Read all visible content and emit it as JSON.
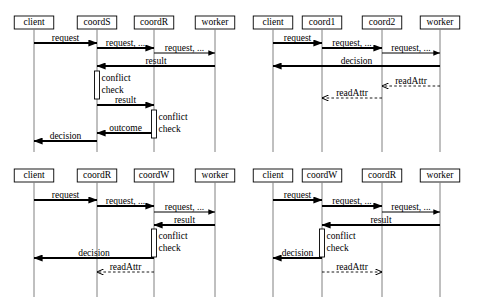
{
  "diagram": {
    "type": "uml-sequence-diagram-grid",
    "panel_count": 4,
    "colors": {
      "background": "#ffffff",
      "stroke": "#000000",
      "lifeline": "#808080",
      "activation_fill": "#ffffff"
    },
    "panels": [
      {
        "id": "panel-top-left",
        "position": "top-left",
        "participants": [
          {
            "name": "client",
            "x": 34
          },
          {
            "name": "coordS",
            "x": 97
          },
          {
            "name": "coordR",
            "x": 154
          },
          {
            "name": "worker",
            "x": 215
          }
        ],
        "messages": [
          {
            "label": "request",
            "from": "client",
            "to": "coordS",
            "y": 43,
            "style": "solid",
            "dir": "right",
            "thick": true
          },
          {
            "label": "request, ...",
            "from": "coordS",
            "to": "coordR",
            "y": 48,
            "style": "solid",
            "dir": "right",
            "thick": true
          },
          {
            "label": "request, ...",
            "from": "coordR",
            "to": "worker",
            "y": 53,
            "style": "solid",
            "dir": "right",
            "thick": false
          },
          {
            "label": "result",
            "from": "worker",
            "to": "coordS",
            "y": 66,
            "style": "solid",
            "dir": "left",
            "thick": true
          },
          {
            "label": "result",
            "from": "coordS",
            "to": "coordR",
            "y": 105,
            "style": "solid",
            "dir": "right",
            "thick": true
          },
          {
            "label": "outcome",
            "from": "coordR",
            "to": "coordS",
            "y": 133,
            "style": "solid",
            "dir": "left",
            "thick": true
          },
          {
            "label": "decision",
            "from": "coordS",
            "to": "client",
            "y": 141,
            "style": "solid",
            "dir": "left",
            "thick": true
          }
        ],
        "activations": [
          {
            "on": "coordS",
            "y1": 71,
            "y2": 99,
            "note": "conflict\ncheck"
          },
          {
            "on": "coordR",
            "y1": 110,
            "y2": 138,
            "note": "conflict\ncheck"
          }
        ]
      },
      {
        "id": "panel-top-right",
        "position": "top-right",
        "participants": [
          {
            "name": "client",
            "x": 273
          },
          {
            "name": "coord1",
            "x": 322
          },
          {
            "name": "coord2",
            "x": 382
          },
          {
            "name": "worker",
            "x": 440
          }
        ],
        "messages": [
          {
            "label": "request",
            "from": "client",
            "to": "coord1",
            "y": 43,
            "style": "solid",
            "dir": "right",
            "thick": true
          },
          {
            "label": "request, ...",
            "from": "coord1",
            "to": "coord2",
            "y": 48,
            "style": "solid",
            "dir": "right",
            "thick": true
          },
          {
            "label": "request, ...",
            "from": "coord2",
            "to": "worker",
            "y": 53,
            "style": "solid",
            "dir": "right",
            "thick": false
          },
          {
            "label": "decision",
            "from": "worker",
            "to": "client",
            "y": 66,
            "style": "solid",
            "dir": "left",
            "thick": true
          },
          {
            "label": "readAttr",
            "from": "worker",
            "to": "coord2",
            "y": 86,
            "style": "dashed",
            "dir": "left",
            "thick": false
          },
          {
            "label": "readAttr",
            "from": "coord2",
            "to": "coord1",
            "y": 98,
            "style": "dashed",
            "dir": "left",
            "thick": false
          }
        ],
        "activations": []
      },
      {
        "id": "panel-bottom-left",
        "position": "bottom-left",
        "participants": [
          {
            "name": "client",
            "x": 34
          },
          {
            "name": "coordR",
            "x": 97
          },
          {
            "name": "coordW",
            "x": 154
          },
          {
            "name": "worker",
            "x": 215
          }
        ],
        "messages": [
          {
            "label": "request",
            "from": "client",
            "to": "coordR",
            "y": 200,
            "style": "solid",
            "dir": "right",
            "thick": true
          },
          {
            "label": "request, ...",
            "from": "coordR",
            "to": "coordW",
            "y": 206,
            "style": "solid",
            "dir": "right",
            "thick": true
          },
          {
            "label": "request, ...",
            "from": "coordW",
            "to": "worker",
            "y": 212,
            "style": "solid",
            "dir": "right",
            "thick": false
          },
          {
            "label": "result",
            "from": "worker",
            "to": "coordW",
            "y": 225,
            "style": "solid",
            "dir": "left",
            "thick": true
          },
          {
            "label": "decision",
            "from": "coordW",
            "to": "client",
            "y": 258,
            "style": "solid",
            "dir": "left",
            "thick": true
          },
          {
            "label": "readAttr",
            "from": "coordW",
            "to": "coordR",
            "y": 272,
            "style": "dashed",
            "dir": "left",
            "thick": false
          }
        ],
        "activations": [
          {
            "on": "coordW",
            "y1": 229,
            "y2": 257,
            "note": "conflict\ncheck"
          }
        ]
      },
      {
        "id": "panel-bottom-right",
        "position": "bottom-right",
        "participants": [
          {
            "name": "client",
            "x": 273
          },
          {
            "name": "coordW",
            "x": 322
          },
          {
            "name": "coordR",
            "x": 382
          },
          {
            "name": "worker",
            "x": 440
          }
        ],
        "messages": [
          {
            "label": "request",
            "from": "client",
            "to": "coordW",
            "y": 200,
            "style": "solid",
            "dir": "right",
            "thick": true
          },
          {
            "label": "request, ...",
            "from": "coordW",
            "to": "coordR",
            "y": 206,
            "style": "solid",
            "dir": "right",
            "thick": true
          },
          {
            "label": "request, ...",
            "from": "coordR",
            "to": "worker",
            "y": 212,
            "style": "solid",
            "dir": "right",
            "thick": false
          },
          {
            "label": "result",
            "from": "worker",
            "to": "coordW",
            "y": 225,
            "style": "solid",
            "dir": "left",
            "thick": true
          },
          {
            "label": "decision",
            "from": "coordW",
            "to": "client",
            "y": 258,
            "style": "solid",
            "dir": "left",
            "thick": true
          },
          {
            "label": "readAttr",
            "from": "coordW",
            "to": "coordR",
            "y": 272,
            "style": "dashed",
            "dir": "right",
            "thick": false
          }
        ],
        "activations": [
          {
            "on": "coordW",
            "y1": 229,
            "y2": 257,
            "note": "conflict\ncheck"
          }
        ]
      }
    ],
    "labels": {
      "client": "client",
      "coordS": "coordS",
      "coordR": "coordR",
      "coordW": "coordW",
      "coord1": "coord1",
      "coord2": "coord2",
      "worker": "worker",
      "request": "request",
      "request_ellipsis": "request, ...",
      "result": "result",
      "outcome": "outcome",
      "decision": "decision",
      "readAttr": "readAttr",
      "conflict": "conflict",
      "check": "check"
    }
  }
}
